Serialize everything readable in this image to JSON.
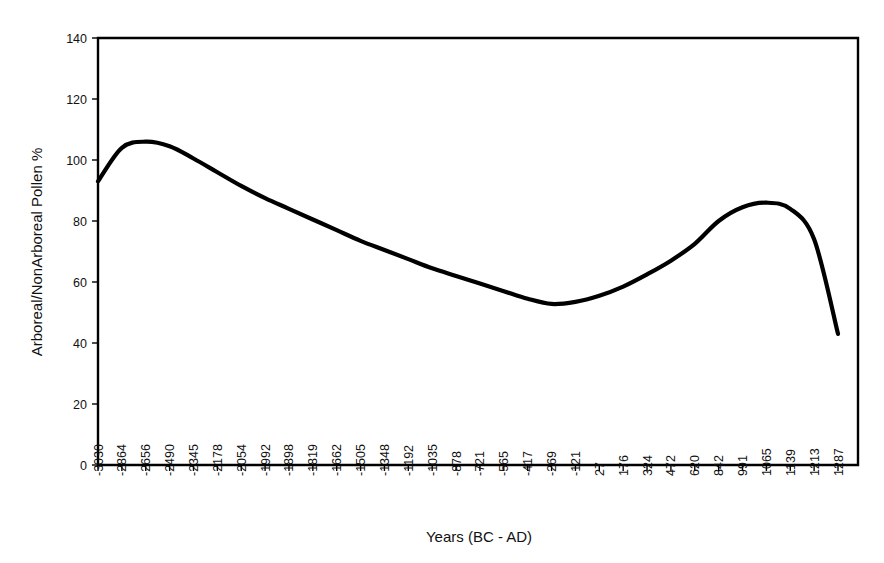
{
  "chart_data": {
    "type": "line",
    "title": "",
    "subtitle": "",
    "xlabel": "Years (BC - AD)",
    "ylabel": "Arboreal/NonArboreal Pollen %",
    "grid": false,
    "legend": null,
    "legend_position": "none",
    "ylim": [
      0,
      140
    ],
    "yticks": [
      0,
      20,
      40,
      60,
      80,
      100,
      120,
      140
    ],
    "ytick_labels": [
      "0",
      "20",
      "40",
      "60",
      "80",
      "100",
      "120",
      "140"
    ],
    "xtick_labels": [
      "-3030",
      "-2864",
      "-2656",
      "-2490",
      "-2345",
      "-2178",
      "-2054",
      "-1992",
      "-1898",
      "-1819",
      "-1662",
      "-1505",
      "-1348",
      "-1192",
      "-1035",
      "-878",
      "-721",
      "-565",
      "-417",
      "-269",
      "-121",
      "27",
      "176",
      "324",
      "472",
      "620",
      "842",
      "991",
      "1065",
      "1139",
      "1213",
      "1287"
    ],
    "categories": [
      "-3030",
      "-2864",
      "-2656",
      "-2490",
      "-2345",
      "-2178",
      "-2054",
      "-1992",
      "-1898",
      "-1819",
      "-1662",
      "-1505",
      "-1348",
      "-1192",
      "-1035",
      "-878",
      "-721",
      "-565",
      "-417",
      "-269",
      "-121",
      "27",
      "176",
      "324",
      "472",
      "620",
      "842",
      "991",
      "1065",
      "1139",
      "1213",
      "1287"
    ],
    "series": [
      {
        "name": "Arboreal/NonArboreal Pollen %",
        "color": "#000000",
        "values": [
          93.0,
          104.0,
          106.0,
          104.5,
          100.5,
          96.0,
          91.5,
          87.5,
          84.0,
          80.5,
          77.0,
          73.5,
          70.5,
          67.5,
          64.5,
          62.0,
          59.5,
          57.0,
          54.5,
          52.8,
          53.5,
          55.5,
          58.5,
          62.5,
          67.0,
          72.5,
          80.0,
          84.5,
          86.0,
          84.0,
          74.0,
          43.0
        ]
      }
    ],
    "annotations": []
  },
  "axes": {
    "y_axis_title": "Arboreal/NonArboreal Pollen %",
    "x_axis_title": "Years (BC - AD)"
  },
  "style": {
    "line_color": "#000000",
    "frame_color": "#000000",
    "background": "#ffffff"
  }
}
